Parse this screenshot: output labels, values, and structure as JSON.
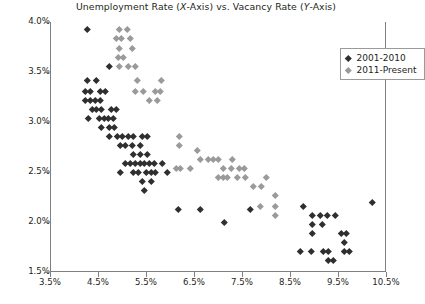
{
  "chart_data": {
    "type": "scatter",
    "title": "Unemployment Rate (X-Axis) vs. Vacancy Rate (Y-Axis)",
    "title_parts": {
      "pre": "Unemployment Rate (",
      "x_italic": "X",
      "mid": "-Axis) vs. Vacancy Rate (",
      "y_italic": "Y",
      "post": "-Axis)"
    },
    "xlabel": "",
    "ylabel": "",
    "xlim": [
      3.5,
      10.5
    ],
    "ylim": [
      1.5,
      4.0
    ],
    "xticks": [
      3.5,
      4.5,
      5.5,
      6.5,
      7.5,
      8.5,
      9.5,
      10.5
    ],
    "xtick_labels": [
      "3.5%",
      "4.5%",
      "5.5%",
      "6.5%",
      "7.5%",
      "8.5%",
      "9.5%",
      "10.5%"
    ],
    "yticks": [
      1.5,
      2.0,
      2.5,
      3.0,
      3.5,
      4.0
    ],
    "ytick_labels": [
      "1.5%",
      "2.0%",
      "2.5%",
      "3.0%",
      "3.5%",
      "4.0%"
    ],
    "grid": false,
    "legend_position": "top-right-inside",
    "marker": "diamond",
    "series": [
      {
        "name": "2001-2010",
        "color": "#2f2f2f",
        "points": [
          [
            4.26,
            3.93
          ],
          [
            4.72,
            3.56
          ],
          [
            4.25,
            3.42
          ],
          [
            4.44,
            3.42
          ],
          [
            4.22,
            3.31
          ],
          [
            4.32,
            3.31
          ],
          [
            4.53,
            3.31
          ],
          [
            4.63,
            3.31
          ],
          [
            4.22,
            3.22
          ],
          [
            4.32,
            3.22
          ],
          [
            4.42,
            3.22
          ],
          [
            4.52,
            3.22
          ],
          [
            4.35,
            3.13
          ],
          [
            4.45,
            3.13
          ],
          [
            4.55,
            3.13
          ],
          [
            4.75,
            3.13
          ],
          [
            4.87,
            3.13
          ],
          [
            4.28,
            3.04
          ],
          [
            4.5,
            3.04
          ],
          [
            4.6,
            3.04
          ],
          [
            4.7,
            3.04
          ],
          [
            4.8,
            3.04
          ],
          [
            4.55,
            2.95
          ],
          [
            4.72,
            2.95
          ],
          [
            4.82,
            2.95
          ],
          [
            4.72,
            2.86
          ],
          [
            4.88,
            2.86
          ],
          [
            4.98,
            2.86
          ],
          [
            5.12,
            2.86
          ],
          [
            5.22,
            2.86
          ],
          [
            5.4,
            2.86
          ],
          [
            5.5,
            2.86
          ],
          [
            4.95,
            2.77
          ],
          [
            5.05,
            2.77
          ],
          [
            5.2,
            2.77
          ],
          [
            5.35,
            2.77
          ],
          [
            5.22,
            2.68
          ],
          [
            5.37,
            2.68
          ],
          [
            5.5,
            2.68
          ],
          [
            5.05,
            2.59
          ],
          [
            5.15,
            2.59
          ],
          [
            5.25,
            2.59
          ],
          [
            5.35,
            2.59
          ],
          [
            5.45,
            2.59
          ],
          [
            5.55,
            2.59
          ],
          [
            5.65,
            2.59
          ],
          [
            5.82,
            2.59
          ],
          [
            4.95,
            2.5
          ],
          [
            5.22,
            2.5
          ],
          [
            5.32,
            2.5
          ],
          [
            5.48,
            2.5
          ],
          [
            5.58,
            2.5
          ],
          [
            5.68,
            2.5
          ],
          [
            5.92,
            2.5
          ],
          [
            5.4,
            2.41
          ],
          [
            5.58,
            2.41
          ],
          [
            5.45,
            2.32
          ],
          [
            6.15,
            2.13
          ],
          [
            6.6,
            2.13
          ],
          [
            7.65,
            2.13
          ],
          [
            7.1,
            2.0
          ],
          [
            8.75,
            2.16
          ],
          [
            8.95,
            2.07
          ],
          [
            9.12,
            2.07
          ],
          [
            9.25,
            2.07
          ],
          [
            9.42,
            2.07
          ],
          [
            8.95,
            1.98
          ],
          [
            9.15,
            1.98
          ],
          [
            8.95,
            1.89
          ],
          [
            9.55,
            1.89
          ],
          [
            9.65,
            1.89
          ],
          [
            9.6,
            1.8
          ],
          [
            8.7,
            1.71
          ],
          [
            8.92,
            1.71
          ],
          [
            9.18,
            1.71
          ],
          [
            9.28,
            1.71
          ],
          [
            9.62,
            1.71
          ],
          [
            9.72,
            1.71
          ],
          [
            9.28,
            1.62
          ],
          [
            9.38,
            1.62
          ],
          [
            10.2,
            2.2
          ]
        ]
      },
      {
        "name": "2011-Present",
        "color": "#9a9a9a",
        "points": [
          [
            4.92,
            3.93
          ],
          [
            5.08,
            3.93
          ],
          [
            4.86,
            3.84
          ],
          [
            4.96,
            3.84
          ],
          [
            5.15,
            3.84
          ],
          [
            4.92,
            3.74
          ],
          [
            5.2,
            3.74
          ],
          [
            4.9,
            3.65
          ],
          [
            5.0,
            3.65
          ],
          [
            4.92,
            3.56
          ],
          [
            5.12,
            3.56
          ],
          [
            5.25,
            3.56
          ],
          [
            5.3,
            3.42
          ],
          [
            5.8,
            3.42
          ],
          [
            5.25,
            3.31
          ],
          [
            5.42,
            3.31
          ],
          [
            5.68,
            3.31
          ],
          [
            5.78,
            3.31
          ],
          [
            5.55,
            3.22
          ],
          [
            5.72,
            3.22
          ],
          [
            6.18,
            2.86
          ],
          [
            6.18,
            2.77
          ],
          [
            6.55,
            2.72
          ],
          [
            6.62,
            2.63
          ],
          [
            6.78,
            2.63
          ],
          [
            6.88,
            2.63
          ],
          [
            6.98,
            2.63
          ],
          [
            7.28,
            2.63
          ],
          [
            6.1,
            2.54
          ],
          [
            6.2,
            2.54
          ],
          [
            6.4,
            2.54
          ],
          [
            7.08,
            2.54
          ],
          [
            7.25,
            2.54
          ],
          [
            7.42,
            2.54
          ],
          [
            7.52,
            2.54
          ],
          [
            6.98,
            2.45
          ],
          [
            7.08,
            2.45
          ],
          [
            7.18,
            2.45
          ],
          [
            7.38,
            2.45
          ],
          [
            7.55,
            2.45
          ],
          [
            7.98,
            2.45
          ],
          [
            7.72,
            2.36
          ],
          [
            7.88,
            2.36
          ],
          [
            8.18,
            2.27
          ],
          [
            7.85,
            2.16
          ],
          [
            8.18,
            2.16
          ],
          [
            8.18,
            2.07
          ]
        ]
      }
    ]
  },
  "legend": {
    "items": [
      {
        "label": "2001-2010"
      },
      {
        "label": "2011-Present"
      }
    ]
  }
}
